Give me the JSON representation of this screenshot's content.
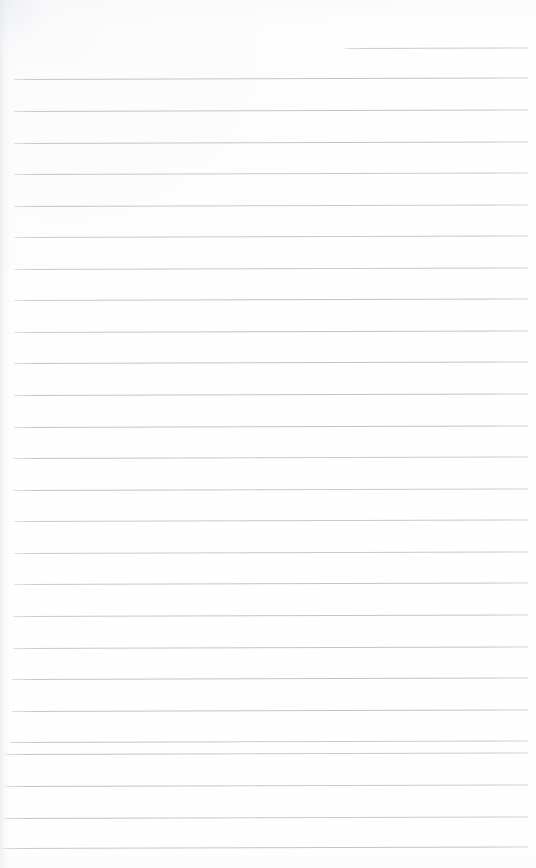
{
  "document": {
    "kind": "scanned-page",
    "title": "Blank ruled notebook page",
    "page_width": 536,
    "page_height": 868,
    "background_color": "#ffffff",
    "written_content": "",
    "written_content_note": "No handwriting, printed text, figures or marks are present on this page.",
    "has_text": false,
    "has_images": false,
    "page_number_label": ""
  },
  "ruling": {
    "line_color": "#bcc2cb",
    "line_thickness_px": 1,
    "line_spacing_px": 31.8,
    "left_margin_px": 14,
    "right_margin_px": 8,
    "first_line_y_px": 48,
    "last_line_y_px": 848,
    "skew_degrees": -0.17,
    "total_line_count": 27,
    "has_vertical_margin_rule": false,
    "partial_first_line": {
      "is_partial": true,
      "start_x_px": 345,
      "end_x_px": 528
    },
    "lines": [
      {
        "y": 48,
        "x_start": 345,
        "x_end": 528,
        "partial": true
      },
      {
        "y": 79,
        "x_start": 14,
        "x_end": 528,
        "partial": false
      },
      {
        "y": 111,
        "x_start": 14,
        "x_end": 528,
        "partial": false
      },
      {
        "y": 143,
        "x_start": 14,
        "x_end": 528,
        "partial": false
      },
      {
        "y": 174,
        "x_start": 14,
        "x_end": 528,
        "partial": false
      },
      {
        "y": 206,
        "x_start": 14,
        "x_end": 528,
        "partial": false
      },
      {
        "y": 237,
        "x_start": 14,
        "x_end": 528,
        "partial": false
      },
      {
        "y": 269,
        "x_start": 14,
        "x_end": 528,
        "partial": false
      },
      {
        "y": 300,
        "x_start": 14,
        "x_end": 528,
        "partial": false
      },
      {
        "y": 332,
        "x_start": 14,
        "x_end": 528,
        "partial": false
      },
      {
        "y": 363,
        "x_start": 14,
        "x_end": 528,
        "partial": false
      },
      {
        "y": 395,
        "x_start": 14,
        "x_end": 528,
        "partial": false
      },
      {
        "y": 427,
        "x_start": 14,
        "x_end": 528,
        "partial": false
      },
      {
        "y": 458,
        "x_start": 14,
        "x_end": 528,
        "partial": false
      },
      {
        "y": 490,
        "x_start": 14,
        "x_end": 528,
        "partial": false
      },
      {
        "y": 521,
        "x_start": 14,
        "x_end": 528,
        "partial": false
      },
      {
        "y": 553,
        "x_start": 14,
        "x_end": 528,
        "partial": false
      },
      {
        "y": 584,
        "x_start": 14,
        "x_end": 528,
        "partial": false
      },
      {
        "y": 616,
        "x_start": 13,
        "x_end": 528,
        "partial": false
      },
      {
        "y": 648,
        "x_start": 13,
        "x_end": 528,
        "partial": false
      },
      {
        "y": 679,
        "x_start": 12,
        "x_end": 528,
        "partial": false
      },
      {
        "y": 711,
        "x_start": 12,
        "x_end": 528,
        "partial": false
      },
      {
        "y": 742,
        "x_start": 10,
        "x_end": 528,
        "partial": false
      },
      {
        "y": 754,
        "x_start": 6,
        "x_end": 528,
        "partial": false
      },
      {
        "y": 786,
        "x_start": 6,
        "x_end": 528,
        "partial": false
      },
      {
        "y": 818,
        "x_start": 4,
        "x_end": 528,
        "partial": false
      },
      {
        "y": 848,
        "x_start": 2,
        "x_end": 528,
        "partial": false
      }
    ]
  },
  "scan_artifacts": {
    "left_edge_shadow": true,
    "top_left_corner_vignette": true,
    "top_edge_falloff": true,
    "bottom_edge_falloff": true,
    "edge_shadow_color": "#dee1e6"
  }
}
